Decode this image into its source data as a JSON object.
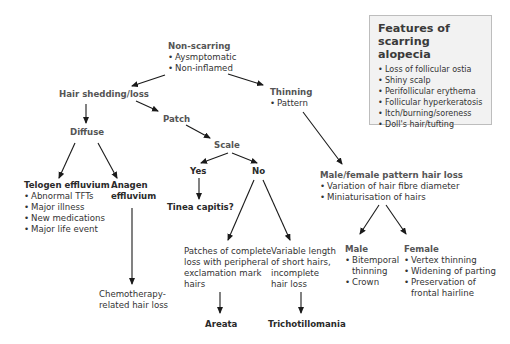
{
  "features_box": {
    "title_line1": "Features of",
    "title_line2": "scarring alopecia",
    "items": [
      "Loss of follicular ostia",
      "Shiny scalp",
      "Perifollicular erythema",
      "Follicular hyperkeratosis",
      "Itch/burning/soreness",
      "Doll's hair/tufting"
    ]
  },
  "nodes": {
    "non_scarring": {
      "title": "Non-scarring",
      "items": [
        "Aysmptomatic",
        "Non-inflamed"
      ]
    },
    "hair_shedding": {
      "title": "Hair shedding/loss"
    },
    "thinning": {
      "title": "Thinning",
      "items": [
        "Pattern"
      ]
    },
    "patch": {
      "title": "Patch"
    },
    "diffuse": {
      "title": "Diffuse"
    },
    "scale": {
      "title": "Scale"
    },
    "yes": {
      "title": "Yes"
    },
    "no": {
      "title": "No"
    },
    "tinea": {
      "title": "Tinea capitis?"
    },
    "telogen": {
      "title": "Telogen effluvium",
      "items": [
        "Abnormal TFTs",
        "Major illness",
        "New medications",
        "Major life event"
      ]
    },
    "anagen": {
      "title_line1": "Anagen",
      "title_line2": "effluvium"
    },
    "chemo": {
      "line1": "Chemotherapy-",
      "line2": "related hair loss"
    },
    "patches_complete": {
      "line1": "Patches of complete",
      "line2": "loss with peripheral",
      "line3": "exclamation mark",
      "line4": "hairs"
    },
    "variable_length": {
      "line1": "Variable length",
      "line2": "of short hairs,",
      "line3": "incomplete",
      "line4": "hair loss"
    },
    "areata": {
      "title": "Areata"
    },
    "trichotillomania": {
      "title": "Trichotillomania"
    },
    "pattern_loss": {
      "title": "Male/female pattern hair loss",
      "items": [
        "Variation of hair fibre diameter",
        "Miniaturisation of hairs"
      ]
    },
    "male": {
      "title": "Male",
      "item1_line1": "Bitemporal",
      "item1_line2": "thinning",
      "item2": "Crown"
    },
    "female": {
      "title": "Female",
      "items": [
        "Vertex thinning",
        "Widening of parting"
      ],
      "item3_line1": "Preservation of",
      "item3_line2": "frontal hairline"
    }
  }
}
